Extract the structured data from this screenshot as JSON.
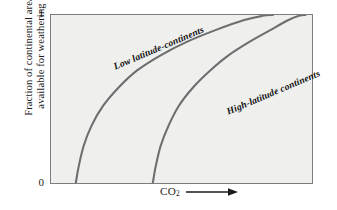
{
  "figure": {
    "background_color": "#ffffff",
    "panel_color": "#efefee",
    "frame_color": "#7d7d7d",
    "curve_color": "#6e6e6e"
  },
  "axes": {
    "y_label_line1": "Fraction of continental area",
    "y_label_line2": "available for weathering",
    "y_tick_top": "1",
    "y_tick_bottom": "0",
    "x_label_text": "CO",
    "x_label_subscript": "2",
    "x_arrow_icon": "right-arrow-icon"
  },
  "annotations": {
    "curve1_label": "Low latitude-continents",
    "curve2_label": "High-latitude continents"
  },
  "chart_data": {
    "type": "line",
    "title": "",
    "subtitle": "",
    "xlabel": "CO2",
    "ylabel": "Fraction of continental area available for weathering",
    "xlim": [
      0,
      1
    ],
    "ylim": [
      0,
      1
    ],
    "x_tick_labels": [],
    "y_tick_labels": [
      "0",
      "1"
    ],
    "grid": false,
    "legend": "inline-curve-labels",
    "series": [
      {
        "name": "Low latitude-continents",
        "comment": "saturating curve; rises from 0 at low CO2, asymptotes to 1",
        "x": [
          0.095,
          0.105,
          0.125,
          0.155,
          0.2,
          0.26,
          0.33,
          0.42,
          0.52,
          0.63,
          0.74,
          0.81,
          0.85
        ],
        "y": [
          0.0,
          0.09,
          0.22,
          0.34,
          0.46,
          0.57,
          0.67,
          0.76,
          0.84,
          0.91,
          0.97,
          0.995,
          1.0
        ]
      },
      {
        "name": "High-latitude continents",
        "comment": "same shape shifted right; reaches 1 at higher CO2",
        "x": [
          0.39,
          0.4,
          0.42,
          0.45,
          0.49,
          0.545,
          0.61,
          0.68,
          0.76,
          0.84,
          0.91,
          0.95,
          0.975
        ],
        "y": [
          0.0,
          0.09,
          0.22,
          0.34,
          0.46,
          0.57,
          0.67,
          0.76,
          0.84,
          0.91,
          0.97,
          0.995,
          1.0
        ]
      }
    ]
  }
}
